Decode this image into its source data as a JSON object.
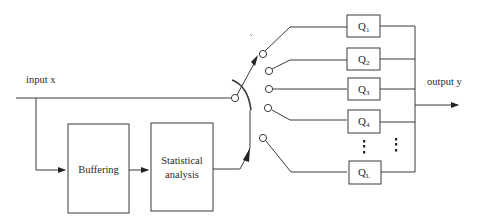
{
  "diagram": {
    "input_label": "input x",
    "output_label": "output y",
    "blocks": {
      "buffering": "Buffering",
      "stat_line1": "Statistical",
      "stat_line2": "analysis"
    },
    "quantizers": [
      {
        "base": "Q",
        "sub": "1"
      },
      {
        "base": "Q",
        "sub": "2"
      },
      {
        "base": "Q",
        "sub": "3"
      },
      {
        "base": "Q",
        "sub": "4"
      },
      {
        "base": "Q",
        "sub": "L"
      }
    ],
    "ellipsis": "⋮"
  }
}
